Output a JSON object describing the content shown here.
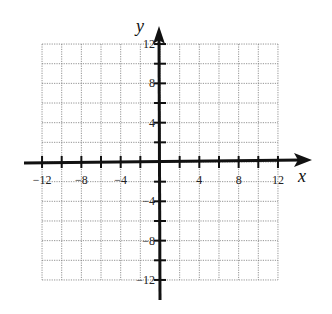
{
  "chart_data": {
    "type": "scatter",
    "title": "",
    "xlabel": "x",
    "ylabel": "y",
    "xlim": [
      -12,
      12
    ],
    "ylim": [
      -12,
      12
    ],
    "grid": true,
    "grid_step": 2,
    "grid_style": "dotted",
    "x_ticks": [
      -12,
      -10,
      -8,
      -6,
      -4,
      -2,
      2,
      4,
      6,
      8,
      10,
      12
    ],
    "y_ticks": [
      -12,
      -10,
      -8,
      -6,
      -4,
      -2,
      2,
      4,
      6,
      8,
      10,
      12
    ],
    "x_tick_labels": [
      "−12",
      "−8",
      "−4",
      "4",
      "8",
      "12"
    ],
    "x_tick_label_values": [
      -12,
      -8,
      -4,
      4,
      8,
      12
    ],
    "y_tick_labels": [
      "12",
      "8",
      "4",
      "−4",
      "−8",
      "−12"
    ],
    "y_tick_label_values": [
      12,
      8,
      4,
      -4,
      -8,
      -12
    ],
    "series": []
  },
  "labels": {
    "x_axis": "x",
    "y_axis": "y"
  }
}
